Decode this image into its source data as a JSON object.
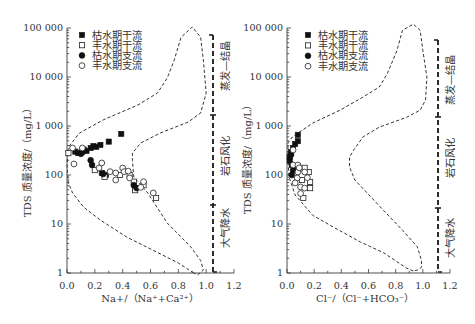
{
  "chart_data": [
    {
      "type": "scatter",
      "title": "",
      "xlabel": "Na+/（Na⁺+Ca²⁺）",
      "ylabel": "TDS 质量浓度/（mg/L）",
      "xlim": [
        0,
        1.2
      ],
      "ylim": [
        1,
        100000
      ],
      "yscale": "log",
      "grid": false,
      "xticks": [
        "0.0",
        "0.2",
        "0.4",
        "0.6",
        "0.8",
        "1.0",
        "1.2"
      ],
      "yticks": [
        "1",
        "10",
        "100",
        "1 000",
        "10 000",
        "100 000"
      ],
      "legend": {
        "position": "top-left",
        "entries": [
          {
            "label": "枯水期干流",
            "marker": "filled-square"
          },
          {
            "label": "丰水期干流",
            "marker": "open-square"
          },
          {
            "label": "枯水期支流",
            "marker": "filled-circle"
          },
          {
            "label": "丰水期支流",
            "marker": "open-circle"
          }
        ]
      },
      "series": [
        {
          "name": "枯水期干流",
          "marker": "filled-square",
          "points": [
            [
              0.39,
              690
            ],
            [
              0.3,
              480
            ],
            [
              0.24,
              410
            ],
            [
              0.21,
              375
            ],
            [
              0.19,
              390
            ],
            [
              0.17,
              355
            ],
            [
              0.14,
              310
            ],
            [
              0.12,
              330
            ],
            [
              0.11,
              295
            ],
            [
              0.08,
              280
            ],
            [
              0.06,
              300
            ],
            [
              0.25,
              110
            ],
            [
              0.28,
              100
            ],
            [
              0.49,
              54
            ]
          ]
        },
        {
          "name": "丰水期干流",
          "marker": "open-square",
          "points": [
            [
              0.01,
              280
            ],
            [
              0.2,
              126
            ],
            [
              0.27,
              92
            ],
            [
              0.38,
              100
            ],
            [
              0.45,
              100
            ],
            [
              0.48,
              73
            ],
            [
              0.49,
              49
            ],
            [
              0.55,
              62
            ],
            [
              0.64,
              34
            ]
          ]
        },
        {
          "name": "枯水期支流",
          "marker": "filled-circle",
          "points": [
            [
              0.17,
              200
            ],
            [
              0.18,
              160
            ],
            [
              0.1,
              270
            ],
            [
              0.26,
              105
            ],
            [
              0.48,
              62
            ],
            [
              0.5,
              54
            ]
          ]
        },
        {
          "name": "丰水期支流",
          "marker": "open-circle",
          "points": [
            [
              0.04,
              356
            ],
            [
              0.11,
              356
            ],
            [
              0.05,
              168
            ],
            [
              0.25,
              176
            ],
            [
              0.23,
              139
            ],
            [
              0.31,
              117
            ],
            [
              0.35,
              110
            ],
            [
              0.4,
              139
            ],
            [
              0.41,
              117
            ],
            [
              0.35,
              79
            ],
            [
              0.45,
              87
            ],
            [
              0.44,
              120
            ],
            [
              0.55,
              73
            ],
            [
              0.53,
              56
            ],
            [
              0.62,
              43
            ]
          ]
        }
      ],
      "envelope": {
        "style": "dashed",
        "points": [
          [
            0.91,
            1.0
          ],
          [
            0.8,
            1.6
          ],
          [
            0.62,
            2.9
          ],
          [
            0.43,
            5.4
          ],
          [
            0.24,
            12
          ],
          [
            0.12,
            22
          ],
          [
            0.04,
            43
          ],
          [
            0.01,
            69
          ],
          [
            0.0,
            160
          ],
          [
            0.01,
            370
          ],
          [
            0.09,
            720
          ],
          [
            0.26,
            1330
          ],
          [
            0.51,
            2690
          ],
          [
            0.65,
            4700
          ],
          [
            0.72,
            9500
          ],
          [
            0.77,
            22000
          ],
          [
            0.82,
            65000
          ],
          [
            0.9,
            105000
          ],
          [
            0.96,
            65000
          ],
          [
            0.98,
            22000
          ],
          [
            1.0,
            4700
          ],
          [
            0.96,
            1840
          ],
          [
            0.87,
            1200
          ],
          [
            0.67,
            720
          ],
          [
            0.53,
            450
          ],
          [
            0.47,
            280
          ],
          [
            0.47,
            200
          ],
          [
            0.48,
            91
          ],
          [
            0.58,
            43
          ],
          [
            0.72,
            10.5
          ],
          [
            0.89,
            3.4
          ],
          [
            0.96,
            1.8
          ],
          [
            0.98,
            1.15
          ],
          [
            0.94,
            0.92
          ]
        ]
      },
      "zones": [
        "蒸发—结晶",
        "岩石风化",
        "大气降水"
      ]
    },
    {
      "type": "scatter",
      "title": "",
      "xlabel": "Cl⁻/（Cl⁻+HCO₃⁻）",
      "ylabel": "TDS 质量浓度/（mg/L）",
      "xlim": [
        0,
        1.2
      ],
      "ylim": [
        1,
        100000
      ],
      "yscale": "log",
      "grid": false,
      "xticks": [
        "0.0",
        "0.2",
        "0.4",
        "0.6",
        "0.8",
        "1.0",
        "1.2"
      ],
      "yticks": [
        "1",
        "10",
        "100",
        "1 000",
        "10 000",
        "100 000"
      ],
      "legend": {
        "position": "top-left",
        "entries": [
          {
            "label": "枯水期干流",
            "marker": "filled-square"
          },
          {
            "label": "丰水期干流",
            "marker": "open-square"
          },
          {
            "label": "枯水期支流",
            "marker": "filled-circle"
          },
          {
            "label": "丰水期支流",
            "marker": "open-circle"
          }
        ]
      },
      "series": [
        {
          "name": "枯水期干流",
          "marker": "filled-square",
          "points": [
            [
              0.08,
              660
            ],
            [
              0.08,
              490
            ],
            [
              0.06,
              430
            ],
            [
              0.045,
              355
            ],
            [
              0.03,
              295
            ],
            [
              0.02,
              235
            ],
            [
              0.02,
              195
            ],
            [
              0.035,
              160
            ]
          ]
        },
        {
          "name": "丰水期干流",
          "marker": "open-square",
          "points": [
            [
              0.11,
              79
            ],
            [
              0.17,
              72
            ],
            [
              0.16,
              115
            ],
            [
              0.12,
              34
            ],
            [
              0.17,
              54
            ],
            [
              0.13,
              140
            ]
          ]
        },
        {
          "name": "枯水期支流",
          "marker": "filled-circle",
          "points": [
            [
              0.045,
              125
            ],
            [
              0.035,
              100
            ],
            [
              0.03,
              260
            ],
            [
              0.05,
              150
            ]
          ]
        },
        {
          "name": "丰水期支流",
          "marker": "open-circle",
          "points": [
            [
              0.045,
              325
            ],
            [
              0.045,
              160
            ],
            [
              0.08,
              160
            ],
            [
              0.08,
              115
            ],
            [
              0.13,
              115
            ],
            [
              0.075,
              87
            ],
            [
              0.1,
              57
            ],
            [
              0.13,
              54
            ],
            [
              0.06,
              69
            ],
            [
              0.1,
              42
            ],
            [
              0.15,
              88
            ],
            [
              0.09,
              140
            ]
          ]
        }
      ],
      "envelope": {
        "style": "dashed",
        "points": [
          [
            0.93,
            1.1
          ],
          [
            0.88,
            1.26
          ],
          [
            0.71,
            2.6
          ],
          [
            0.54,
            4.3
          ],
          [
            0.34,
            8.7
          ],
          [
            0.19,
            15
          ],
          [
            0.11,
            27
          ],
          [
            0.06,
            39
          ],
          [
            0.04,
            57
          ],
          [
            0.015,
            91
          ],
          [
            0.007,
            200
          ],
          [
            0.007,
            450
          ],
          [
            0.04,
            600
          ],
          [
            0.19,
            1150
          ],
          [
            0.39,
            2100
          ],
          [
            0.56,
            3900
          ],
          [
            0.68,
            6250
          ],
          [
            0.74,
            12000
          ],
          [
            0.81,
            35000
          ],
          [
            0.85,
            90000
          ],
          [
            0.93,
            120000
          ],
          [
            0.98,
            90000
          ],
          [
            1.0,
            35000
          ],
          [
            1.03,
            10000
          ],
          [
            1.02,
            3400
          ],
          [
            0.98,
            2100
          ],
          [
            0.88,
            1500
          ],
          [
            0.68,
            950
          ],
          [
            0.56,
            600
          ],
          [
            0.49,
            320
          ],
          [
            0.46,
            230
          ],
          [
            0.46,
            146
          ],
          [
            0.5,
            79
          ],
          [
            0.59,
            43
          ],
          [
            0.71,
            19
          ],
          [
            0.85,
            7.5
          ],
          [
            0.96,
            3.4
          ],
          [
            0.99,
            1.8
          ],
          [
            0.99,
            1.3
          ],
          [
            0.96,
            1.15
          ]
        ]
      },
      "zones": [
        "蒸发—结晶",
        "岩石风化",
        "大气降水"
      ]
    }
  ]
}
